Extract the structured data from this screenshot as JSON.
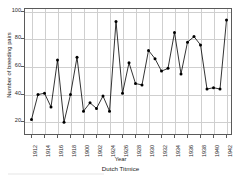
{
  "chart_data": {
    "type": "line",
    "title": "",
    "xlabel": "Year",
    "ylabel": "Number of breeding pairs",
    "caption": "Dutch Titmice",
    "grid": true,
    "legend": "none",
    "marker": "filled-circle",
    "line_color": "#000000",
    "marker_color": "#000000",
    "grid_color": "#cfcfcf",
    "axis_color": "#5a5a5a",
    "xlim": [
      1911,
      1943
    ],
    "ylim": [
      10,
      102
    ],
    "ytick_values": [
      20,
      40,
      60,
      80,
      100
    ],
    "ytick_labels": [
      "20",
      "40",
      "60",
      "80",
      "100"
    ],
    "xtick_values": [
      1912,
      1914,
      1916,
      1918,
      1920,
      1922,
      1924,
      1926,
      1928,
      1930,
      1932,
      1934,
      1936,
      1938,
      1940,
      1942
    ],
    "xtick_labels": [
      "1912",
      "1914",
      "1916",
      "1918",
      "1900",
      "1902",
      "1924",
      "1926",
      "1928",
      "1930",
      "1932",
      "1934",
      "1936",
      "1938",
      "1940",
      "1942"
    ],
    "x": [
      1912,
      1913,
      1914,
      1915,
      1916,
      1917,
      1918,
      1919,
      1920,
      1921,
      1922,
      1923,
      1924,
      1925,
      1926,
      1927,
      1928,
      1929,
      1930,
      1931,
      1932,
      1933,
      1934,
      1935,
      1936,
      1937,
      1938,
      1939,
      1940,
      1941,
      1942
    ],
    "values": [
      22,
      40,
      41,
      31,
      65,
      20,
      40,
      67,
      28,
      34,
      30,
      39,
      28,
      93,
      41,
      63,
      48,
      47,
      72,
      66,
      57,
      59,
      85,
      55,
      78,
      82,
      76,
      44,
      45,
      44,
      94
    ],
    "series": [
      {
        "name": "Number of breeding pairs",
        "values": [
          22,
          40,
          41,
          31,
          65,
          20,
          40,
          67,
          28,
          34,
          30,
          39,
          28,
          93,
          41,
          63,
          48,
          47,
          72,
          66,
          57,
          59,
          85,
          55,
          78,
          82,
          76,
          44,
          45,
          44,
          94
        ]
      }
    ]
  }
}
